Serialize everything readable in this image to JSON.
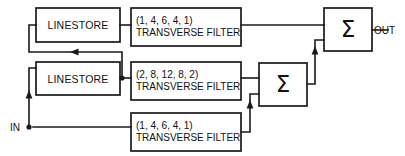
{
  "diagram": {
    "colors": {
      "line": "#1a1a1a",
      "box_fill": "#ffffff",
      "text": "#111111",
      "background": "#ffffff"
    },
    "ports": {
      "input_label": "IN",
      "output_label": "OUT"
    },
    "blocks": {
      "linestore_top": {
        "label": "LINESTORE"
      },
      "linestore_middle": {
        "label": "LINESTORE"
      },
      "filter_top": {
        "coefficients": "(1, 4, 6, 4, 1)",
        "name": "TRANSVERSE FILTER"
      },
      "filter_middle": {
        "coefficients": "(2, 8, 12, 8, 2)",
        "name": "TRANSVERSE FILTER"
      },
      "filter_bottom": {
        "coefficients": "(1, 4, 6, 4, 1)",
        "name": "TRANSVERSE FILTER"
      },
      "adder_output": {
        "symbol": "Σ"
      },
      "adder_intermediate": {
        "symbol": "Σ"
      }
    }
  }
}
